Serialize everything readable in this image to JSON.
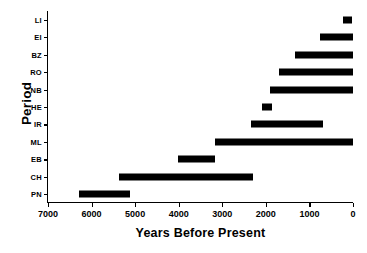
{
  "chart_data": {
    "type": "bar",
    "orientation": "horizontal",
    "title": "",
    "subtitle": "",
    "xlabel": "Years Before Present",
    "ylabel": "Period",
    "xlim": [
      7000,
      0
    ],
    "x_axis_reversed": true,
    "xticks": [
      7000,
      6000,
      5000,
      4000,
      3000,
      2000,
      1000,
      0
    ],
    "xticklabels": [
      "7000",
      "6000",
      "5000",
      "4000",
      "3000",
      "2000",
      "1000",
      "0"
    ],
    "grid": false,
    "legend": null,
    "bar_color": "#000000",
    "categories": [
      "LI",
      "EI",
      "BZ",
      "RO",
      "NB",
      "HE",
      "IR",
      "ML",
      "EB",
      "CH",
      "PN"
    ],
    "bars": [
      {
        "category": "LI",
        "start": 230,
        "end": 25
      },
      {
        "category": "EI",
        "start": 760,
        "end": 0
      },
      {
        "category": "BZ",
        "start": 1330,
        "end": 0
      },
      {
        "category": "RO",
        "start": 1700,
        "end": 0
      },
      {
        "category": "NB",
        "start": 1900,
        "end": 0
      },
      {
        "category": "HE",
        "start": 2090,
        "end": 1860
      },
      {
        "category": "IR",
        "start": 2340,
        "end": 690
      },
      {
        "category": "ML",
        "start": 3170,
        "end": 0
      },
      {
        "category": "EB",
        "start": 4020,
        "end": 3170
      },
      {
        "category": "CH",
        "start": 5370,
        "end": 2300
      },
      {
        "category": "PN",
        "start": 6280,
        "end": 5115
      }
    ]
  }
}
